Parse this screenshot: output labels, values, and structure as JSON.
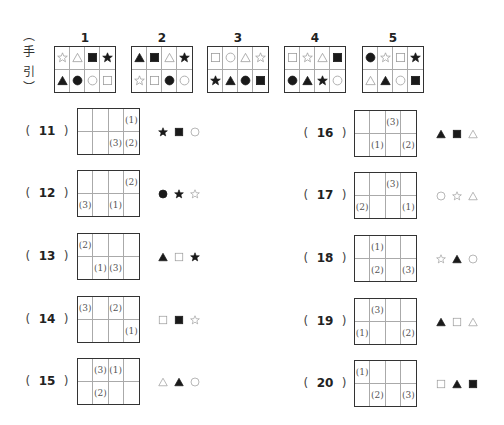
{
  "hint": {
    "open_paren": "︵",
    "chars": [
      "手",
      "引"
    ],
    "close_paren": "︶"
  },
  "references": [
    {
      "label": "1",
      "cells": [
        "star-outline",
        "triangle-outline",
        "square-filled",
        "star-filled",
        "triangle-filled",
        "circle-filled",
        "circle-outline",
        "square-outline"
      ]
    },
    {
      "label": "2",
      "cells": [
        "triangle-filled",
        "square-filled",
        "triangle-outline",
        "star-filled",
        "star-outline",
        "square-outline",
        "circle-filled",
        "circle-outline"
      ]
    },
    {
      "label": "3",
      "cells": [
        "square-outline",
        "circle-outline",
        "triangle-outline",
        "star-outline",
        "star-filled",
        "triangle-filled",
        "circle-filled",
        "square-filled"
      ]
    },
    {
      "label": "4",
      "cells": [
        "square-outline",
        "star-outline",
        "triangle-outline",
        "square-filled",
        "circle-filled",
        "triangle-filled",
        "star-filled",
        "circle-outline"
      ]
    },
    {
      "label": "5",
      "cells": [
        "circle-filled",
        "star-outline",
        "square-outline",
        "star-filled",
        "triangle-outline",
        "triangle-filled",
        "circle-outline",
        "square-filled"
      ]
    }
  ],
  "questions": [
    {
      "number": "11",
      "cells": [
        "",
        "",
        "",
        "(1)",
        "",
        "",
        "(3)",
        "(2)"
      ],
      "symbols": [
        "star-filled",
        "square-filled",
        "circle-outline"
      ]
    },
    {
      "number": "12",
      "cells": [
        "",
        "",
        "",
        "(2)",
        "(3)",
        "",
        "(1)",
        ""
      ],
      "symbols": [
        "circle-filled",
        "star-filled",
        "star-outline"
      ]
    },
    {
      "number": "13",
      "cells": [
        "(2)",
        "",
        "",
        "",
        "",
        "(1)",
        "(3)",
        ""
      ],
      "symbols": [
        "triangle-filled",
        "square-outline",
        "star-filled"
      ]
    },
    {
      "number": "14",
      "cells": [
        "(3)",
        "",
        "(2)",
        "",
        "",
        "",
        "",
        "(1)"
      ],
      "symbols": [
        "square-outline",
        "square-filled",
        "star-outline"
      ]
    },
    {
      "number": "15",
      "cells": [
        "",
        "(3)",
        "(1)",
        "",
        "",
        "(2)",
        "",
        ""
      ],
      "symbols": [
        "triangle-outline",
        "triangle-filled",
        "circle-outline"
      ]
    },
    {
      "number": "16",
      "cells": [
        "",
        "",
        "(3)",
        "",
        "",
        "(1)",
        "",
        "(2)"
      ],
      "symbols": [
        "triangle-filled",
        "square-filled",
        "triangle-outline"
      ]
    },
    {
      "number": "17",
      "cells": [
        "",
        "",
        "(3)",
        "",
        "(2)",
        "",
        "",
        "(1)"
      ],
      "symbols": [
        "circle-outline",
        "star-outline",
        "triangle-outline"
      ]
    },
    {
      "number": "18",
      "cells": [
        "",
        "(1)",
        "",
        "",
        "",
        "(2)",
        "",
        "(3)"
      ],
      "symbols": [
        "star-outline",
        "triangle-filled",
        "circle-outline"
      ]
    },
    {
      "number": "19",
      "cells": [
        "",
        "(3)",
        "",
        "",
        "(1)",
        "",
        "",
        "(2)"
      ],
      "symbols": [
        "triangle-filled",
        "square-outline",
        "triangle-outline"
      ]
    },
    {
      "number": "20",
      "cells": [
        "(1)",
        "",
        "",
        "",
        "",
        "(2)",
        "",
        "(3)"
      ],
      "symbols": [
        "square-outline",
        "triangle-filled",
        "square-filled"
      ]
    }
  ],
  "paren_open": "(",
  "paren_close": ")",
  "colors": {
    "filled": "#1a1a1a",
    "outline": "#999999",
    "border": "#333333"
  }
}
